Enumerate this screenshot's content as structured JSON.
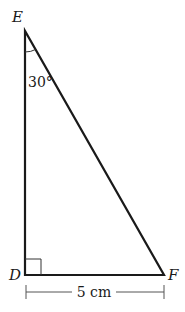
{
  "diagram": {
    "type": "right-triangle",
    "vertices": {
      "E": {
        "label": "E"
      },
      "D": {
        "label": "D"
      },
      "F": {
        "label": "F"
      }
    },
    "angle_E": "30°",
    "right_angle_at": "D",
    "side_DF_length": "5 cm",
    "colors": {
      "stroke": "#1a1a1a",
      "dimension": "#555555",
      "background": "#ffffff"
    }
  }
}
